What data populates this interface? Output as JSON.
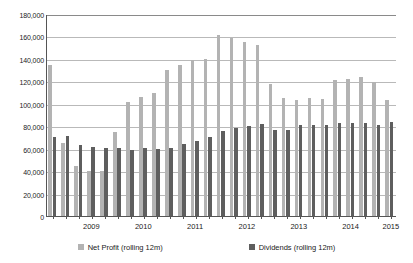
{
  "chart_data": {
    "type": "bar",
    "title": "",
    "subtitle": "",
    "xlabel": "",
    "ylabel": "",
    "ylim": [
      0,
      180000
    ],
    "ytick_step": 20000,
    "ytick_labels": [
      "180,000",
      "160,000",
      "140,000",
      "120,000",
      "100,000",
      "80,000",
      "60,000",
      "40,000",
      "20,000",
      "0"
    ],
    "ytick_values": [
      180000,
      160000,
      140000,
      120000,
      100000,
      80000,
      60000,
      40000,
      20000,
      0
    ],
    "grid": true,
    "grid_axis": "y",
    "legend_position": "bottom",
    "x_tick_labels": [
      "2009",
      "2010",
      "2011",
      "2012",
      "2013",
      "2014",
      "2015"
    ],
    "x_tick_positions": [
      3.5,
      7.5,
      11.5,
      15.5,
      19.5,
      23.5,
      26.6
    ],
    "categories": [
      "2008 Q3",
      "2008 Q4",
      "2009 Q1",
      "2009 Q2",
      "2009 Q3",
      "2009 Q4",
      "2010 Q1",
      "2010 Q2",
      "2010 Q3",
      "2010 Q4",
      "2011 Q1",
      "2011 Q2",
      "2011 Q3",
      "2011 Q4",
      "2012 Q1",
      "2012 Q2",
      "2012 Q3",
      "2012 Q4",
      "2013 Q1",
      "2013 Q2",
      "2013 Q3",
      "2013 Q4",
      "2014 Q1",
      "2014 Q2",
      "2014 Q3",
      "2014 Q4",
      "2015 Q1"
    ],
    "series": [
      {
        "name": "Net Profit (rolling 12m)",
        "color": "#b3b3b3",
        "values": [
          134500,
          65000,
          44500,
          40000,
          40000,
          74500,
          101500,
          106000,
          110000,
          130000,
          135000,
          139000,
          140000,
          161000,
          158500,
          155500,
          152000,
          117500,
          105500,
          103500,
          105000,
          104000,
          121500,
          122000,
          123500,
          119000,
          103000
        ]
      },
      {
        "name": "Dividends (rolling 12m)",
        "color": "#5e5e5e",
        "values": [
          70000,
          71500,
          63500,
          61500,
          60500,
          60500,
          58500,
          60500,
          59500,
          60500,
          64500,
          66500,
          70500,
          75500,
          78500,
          80500,
          82000,
          76500,
          77000,
          81000,
          81000,
          81000,
          82500,
          82500,
          82500,
          81500,
          84000
        ]
      }
    ]
  },
  "legend": {
    "entries": [
      {
        "label": "Net Profit (rolling 12m)"
      },
      {
        "label": "Dividends (rolling 12m)"
      }
    ]
  }
}
